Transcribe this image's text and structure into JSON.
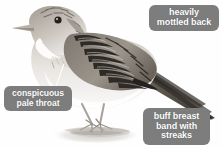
{
  "figure": {
    "kind": "bird-identification-illustration",
    "background_color": "#fefefe"
  },
  "callouts": [
    {
      "id": "heavily-mottled-back",
      "lines": [
        "heavily",
        "mottled back"
      ],
      "box_color": "#7d7d7d",
      "text_color": "#ffffff",
      "points_to": "back"
    },
    {
      "id": "conspicuous-pale-throat",
      "lines": [
        "conspicuous",
        "pale throat"
      ],
      "box_color": "#7d7d7d",
      "text_color": "#ffffff",
      "points_to": "throat"
    },
    {
      "id": "buff-breast-band-with-streaks",
      "lines": [
        "buff breast",
        "band with",
        "streaks"
      ],
      "box_color": "#7d7d7d",
      "text_color": "#ffffff",
      "points_to": "breast"
    }
  ],
  "illustration": {
    "body_fill_light": "#f2f0ed",
    "body_fill_mid": "#cfcac4",
    "body_fill_dark": "#8a847d",
    "marking_color": "#3a3631",
    "bill_color": "#b9b2a8",
    "eye_color": "#23201d",
    "leg_color": "#b3aca3",
    "shadow_color": "#d9d6d2",
    "leader_color": "#ffffff"
  }
}
